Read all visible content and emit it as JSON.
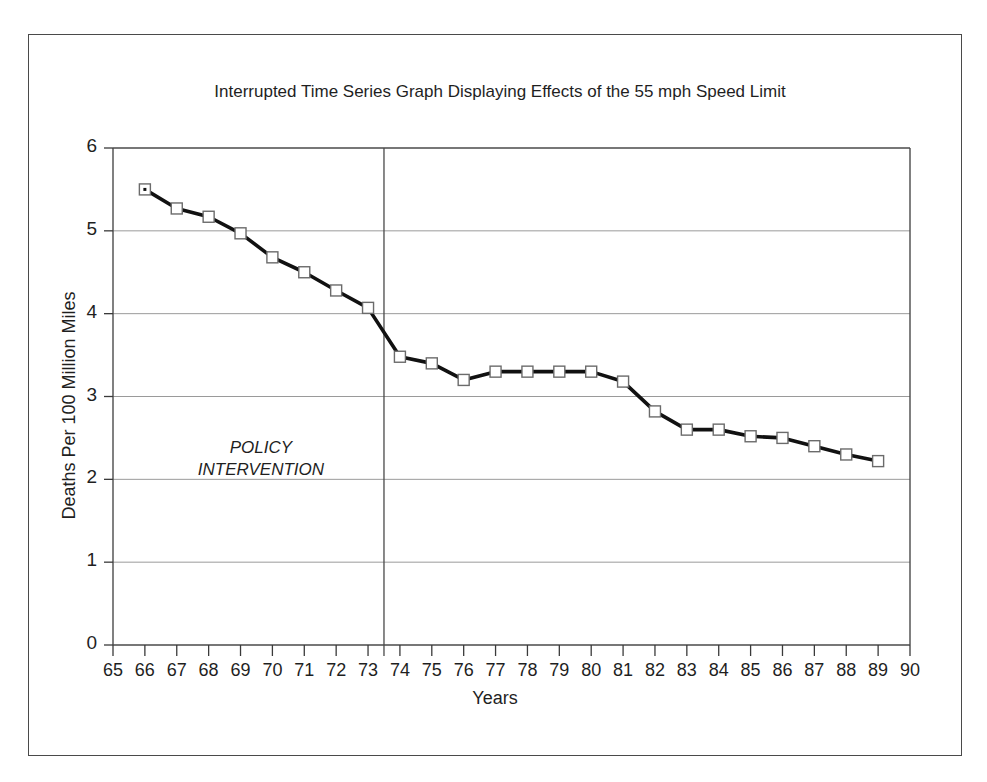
{
  "figure": {
    "title": "Interrupted Time Series Graph Displaying Effects of the 55 mph\nSpeed Limit",
    "annotation": "POLICY\nINTERVENTION",
    "frame_color": "#4a4a4a",
    "background": "#ffffff"
  },
  "chart_data": {
    "type": "line",
    "title": "Interrupted Time Series Graph Displaying Effects of the 55 mph Speed Limit",
    "xlabel": "Years",
    "ylabel": "Deaths Per 100 Million Miles",
    "xlim": [
      65,
      90
    ],
    "ylim": [
      0,
      6
    ],
    "xticks": [
      65,
      66,
      67,
      68,
      69,
      70,
      71,
      72,
      73,
      74,
      75,
      76,
      77,
      78,
      79,
      80,
      81,
      82,
      83,
      84,
      85,
      86,
      87,
      88,
      89,
      90
    ],
    "yticks": [
      0,
      1,
      2,
      3,
      4,
      5,
      6
    ],
    "xtick_labels": [
      "65",
      "66",
      "67",
      "68",
      "69",
      "70",
      "71",
      "72",
      "73",
      "74",
      "75",
      "76",
      "77",
      "78",
      "79",
      "80",
      "81",
      "82",
      "83",
      "84",
      "85",
      "86",
      "87",
      "88",
      "89",
      "90"
    ],
    "ytick_labels": [
      "0",
      "1",
      "2",
      "3",
      "4",
      "5",
      "6"
    ],
    "grid": "horizontal",
    "legend": "none",
    "marker": "open-square",
    "line_color": "#111111",
    "marker_edge_color": "#6b6b6b",
    "marker_face_color": "#ffffff",
    "x": [
      66,
      67,
      68,
      69,
      70,
      71,
      72,
      73,
      74,
      75,
      76,
      77,
      78,
      79,
      80,
      81,
      82,
      83,
      84,
      85,
      86,
      87,
      88,
      89
    ],
    "values": [
      5.5,
      5.27,
      5.17,
      4.97,
      4.68,
      4.5,
      4.28,
      4.07,
      3.48,
      3.4,
      3.2,
      3.3,
      3.3,
      3.3,
      3.3,
      3.18,
      2.82,
      2.6,
      2.6,
      2.52,
      2.5,
      2.4,
      2.3,
      2.22
    ],
    "annotations": [
      {
        "label": "POLICY INTERVENTION",
        "type": "vertical-line",
        "x": 73.5,
        "style": "solid",
        "color": "#4a4a4a"
      }
    ]
  }
}
